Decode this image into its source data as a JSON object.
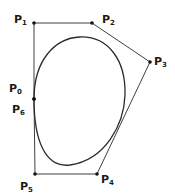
{
  "diagram": {
    "type": "closed-bezier-curve-with-control-polygon",
    "stroke_color": "#2a2a2a",
    "points": [
      {
        "id": "P0",
        "label": "P",
        "sub": "0",
        "x": 34,
        "y": 99,
        "label_x": 9,
        "label_y": 83
      },
      {
        "id": "P1",
        "label": "P",
        "sub": "1",
        "x": 34,
        "y": 23,
        "label_x": 14,
        "label_y": 14
      },
      {
        "id": "P2",
        "label": "P",
        "sub": "2",
        "x": 92,
        "y": 23,
        "label_x": 102,
        "label_y": 14
      },
      {
        "id": "P3",
        "label": "P",
        "sub": "3",
        "x": 150,
        "y": 62,
        "label_x": 154,
        "label_y": 56
      },
      {
        "id": "P4",
        "label": "P",
        "sub": "4",
        "x": 97,
        "y": 174,
        "label_x": 101,
        "label_y": 174
      },
      {
        "id": "P5",
        "label": "P",
        "sub": "5",
        "x": 35,
        "y": 174,
        "label_x": 20,
        "label_y": 181
      },
      {
        "id": "P6",
        "label": "P",
        "sub": "6",
        "x": 34,
        "y": 99,
        "label_x": 12,
        "label_y": 104
      }
    ],
    "curve_path": "M34,99 C34,60 55,38 80,37 C108,36 126,60 125,95 C124,125 105,160 70,165 C45,168 34,140 34,99 Z"
  }
}
